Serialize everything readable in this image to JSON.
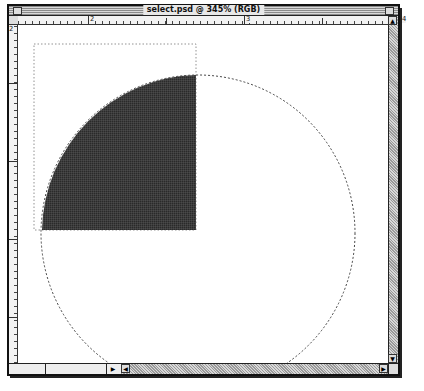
{
  "window": {
    "title": "select.psd @ 345% (RGB)",
    "zoom_level": "345%",
    "color_mode": "RGB",
    "filename": "select.psd"
  },
  "rulers": {
    "top_labels": [
      "2",
      "3",
      "4"
    ],
    "left_labels": [
      "2"
    ]
  },
  "canvas": {
    "background": "#ffffff",
    "filled_quarter_color": "#3a3a3a",
    "selection_style": "marching-ants"
  },
  "status_bar": {
    "zoom": "",
    "doc_info": ""
  },
  "icons": {
    "close_box": "close-box-icon",
    "zoom_box": "zoom-box-icon",
    "scroll_up": "▲",
    "scroll_down": "▼",
    "scroll_left": "◀",
    "scroll_right": "▶",
    "status_arrow": "▶"
  }
}
